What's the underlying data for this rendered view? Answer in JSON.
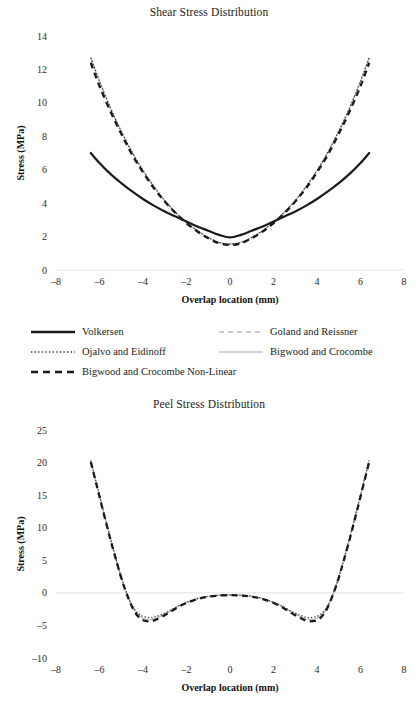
{
  "chart_data": [
    {
      "type": "line",
      "title": "Shear Stress Distribution",
      "xlabel": "Overlap location (mm)",
      "ylabel": "Stress (MPa)",
      "xlim": [
        -8,
        8
      ],
      "ylim": [
        0,
        14
      ],
      "xticks": [
        -8,
        -6,
        -4,
        -2,
        0,
        2,
        4,
        6,
        8
      ],
      "yticks": [
        0,
        2,
        4,
        6,
        8,
        10,
        12,
        14
      ],
      "grid": false,
      "legend_position": "below",
      "x": [
        -6.4,
        -6.0,
        -5.5,
        -5.0,
        -4.5,
        -4.0,
        -3.5,
        -3.0,
        -2.5,
        -2.0,
        -1.5,
        -1.0,
        -0.5,
        0.0,
        0.5,
        1.0,
        1.5,
        2.0,
        2.5,
        3.0,
        3.5,
        4.0,
        4.5,
        5.0,
        5.5,
        6.0,
        6.4
      ],
      "series": [
        {
          "name": "Volkersen",
          "style": "solid",
          "color": "#1a1a1a",
          "width": 2.2,
          "values": [
            7.0,
            6.4,
            5.75,
            5.2,
            4.7,
            4.25,
            3.85,
            3.5,
            3.2,
            2.9,
            2.6,
            2.35,
            2.1,
            1.95,
            2.1,
            2.35,
            2.6,
            2.9,
            3.2,
            3.5,
            3.85,
            4.25,
            4.7,
            5.2,
            5.75,
            6.4,
            7.0
          ]
        },
        {
          "name": "Goland and Reissner",
          "style": "dashed",
          "color": "#b9b9b9",
          "width": 1.2,
          "values": [
            12.7,
            11.3,
            9.7,
            8.3,
            7.05,
            5.95,
            5.0,
            4.15,
            3.45,
            2.85,
            2.35,
            1.95,
            1.65,
            1.55,
            1.65,
            1.95,
            2.35,
            2.85,
            3.45,
            4.15,
            5.0,
            5.95,
            7.05,
            8.3,
            9.7,
            11.3,
            12.7
          ]
        },
        {
          "name": "Ojalvo and Eidinoff",
          "style": "dotted",
          "color": "#3a3a3a",
          "width": 1.3,
          "values": [
            12.7,
            11.3,
            9.7,
            8.3,
            7.05,
            5.95,
            5.0,
            4.15,
            3.45,
            2.85,
            2.35,
            1.95,
            1.65,
            1.55,
            1.65,
            1.95,
            2.35,
            2.85,
            3.45,
            4.15,
            5.0,
            5.95,
            7.05,
            8.3,
            9.7,
            11.3,
            12.7
          ]
        },
        {
          "name": "Bigwood and Crocombe",
          "style": "solid-light",
          "color": "#c4c4c4",
          "width": 1.1,
          "values": [
            12.7,
            11.3,
            9.7,
            8.3,
            7.05,
            5.95,
            5.0,
            4.15,
            3.45,
            2.85,
            2.35,
            1.95,
            1.65,
            1.55,
            1.65,
            1.95,
            2.35,
            2.85,
            3.45,
            4.15,
            5.0,
            5.95,
            7.05,
            8.3,
            9.7,
            11.3,
            12.7
          ]
        },
        {
          "name": "Bigwood and Crocombe Non-Linear",
          "style": "thick-dashed",
          "color": "#1a1a1a",
          "width": 2.3,
          "values": [
            12.4,
            11.0,
            9.5,
            8.15,
            6.9,
            5.85,
            4.9,
            4.1,
            3.4,
            2.8,
            2.3,
            1.9,
            1.6,
            1.5,
            1.6,
            1.9,
            2.3,
            2.8,
            3.4,
            4.1,
            4.9,
            5.85,
            6.9,
            8.15,
            9.5,
            11.0,
            12.4
          ]
        }
      ]
    },
    {
      "type": "line",
      "title": "Peel Stress Distribution",
      "xlabel": "Overlap location (mm)",
      "ylabel": "Stress (MPa)",
      "xlim": [
        -8,
        8
      ],
      "ylim": [
        -10,
        25
      ],
      "xticks": [
        -8,
        -6,
        -4,
        -2,
        0,
        2,
        4,
        6,
        8
      ],
      "yticks": [
        -10,
        -5,
        0,
        5,
        10,
        15,
        20,
        25
      ],
      "grid": false,
      "legend_position": "shared-above",
      "x": [
        -6.4,
        -6.1,
        -5.8,
        -5.5,
        -5.2,
        -5.0,
        -4.8,
        -4.6,
        -4.4,
        -4.2,
        -4.0,
        -3.6,
        -3.2,
        -2.8,
        -2.4,
        -2.0,
        -1.5,
        -1.0,
        -0.5,
        0.0,
        0.5,
        1.0,
        1.5,
        2.0,
        2.4,
        2.8,
        3.2,
        3.6,
        4.0,
        4.2,
        4.4,
        4.6,
        4.8,
        5.0,
        5.2,
        5.5,
        5.8,
        6.1,
        6.4
      ],
      "series": [
        {
          "name": "Goland and Reissner",
          "style": "dashed",
          "color": "#b9b9b9",
          "width": 1.2,
          "values": [
            20.3,
            16.3,
            12.3,
            8.4,
            4.7,
            2.4,
            0.4,
            -1.3,
            -2.6,
            -3.4,
            -3.9,
            -4.1,
            -3.6,
            -2.9,
            -2.1,
            -1.5,
            -0.9,
            -0.55,
            -0.38,
            -0.33,
            -0.38,
            -0.55,
            -0.9,
            -1.5,
            -2.1,
            -2.9,
            -3.6,
            -4.1,
            -3.9,
            -3.4,
            -2.6,
            -1.3,
            0.4,
            2.4,
            4.7,
            8.4,
            12.3,
            16.3,
            20.3
          ]
        },
        {
          "name": "Ojalvo and Eidinoff",
          "style": "dotted",
          "color": "#3a3a3a",
          "width": 1.3,
          "values": [
            20.3,
            16.3,
            12.3,
            8.4,
            4.7,
            2.4,
            0.4,
            -1.3,
            -2.5,
            -3.2,
            -3.6,
            -3.8,
            -3.4,
            -2.8,
            -2.05,
            -1.45,
            -0.88,
            -0.53,
            -0.36,
            -0.31,
            -0.36,
            -0.53,
            -0.88,
            -1.45,
            -2.05,
            -2.8,
            -3.4,
            -3.8,
            -3.6,
            -3.2,
            -2.5,
            -1.3,
            0.4,
            2.4,
            4.7,
            8.4,
            12.3,
            16.3,
            20.3
          ]
        },
        {
          "name": "Bigwood and Crocombe",
          "style": "solid-light",
          "color": "#c4c4c4",
          "width": 1.1,
          "values": [
            20.3,
            16.3,
            12.3,
            8.4,
            4.7,
            2.4,
            0.4,
            -1.3,
            -2.6,
            -3.4,
            -3.9,
            -4.1,
            -3.6,
            -2.9,
            -2.1,
            -1.5,
            -0.9,
            -0.55,
            -0.38,
            -0.33,
            -0.38,
            -0.55,
            -0.9,
            -1.5,
            -2.1,
            -2.9,
            -3.6,
            -4.1,
            -3.9,
            -3.4,
            -2.6,
            -1.3,
            0.4,
            2.4,
            4.7,
            8.4,
            12.3,
            16.3,
            20.3
          ]
        },
        {
          "name": "Bigwood and Crocombe Non-Linear",
          "style": "thick-dashed",
          "color": "#1a1a1a",
          "width": 2.3,
          "values": [
            20.1,
            16.1,
            12.1,
            8.2,
            4.6,
            2.3,
            0.3,
            -1.4,
            -2.8,
            -3.7,
            -4.2,
            -4.35,
            -3.8,
            -3.05,
            -2.2,
            -1.55,
            -0.95,
            -0.6,
            -0.42,
            -0.36,
            -0.42,
            -0.6,
            -0.95,
            -1.55,
            -2.2,
            -3.05,
            -3.8,
            -4.35,
            -4.2,
            -3.7,
            -2.8,
            -1.4,
            0.3,
            2.3,
            4.6,
            8.2,
            12.1,
            16.1,
            20.1
          ]
        }
      ]
    }
  ],
  "shear": {
    "title": "Shear Stress Distribution",
    "ylabel": "Stress (MPa)",
    "xlabel": "Overlap location (mm)",
    "yticks": [
      "14",
      "12",
      "10",
      "8",
      "6",
      "4",
      "2",
      "0"
    ],
    "xticks": [
      "-8",
      "-6",
      "-4",
      "-2",
      "0",
      "2",
      "4",
      "6",
      "8"
    ]
  },
  "peel": {
    "title": "Peel Stress Distribution",
    "ylabel": "Stress (MPa)",
    "xlabel": "Overlap location (mm)",
    "yticks": [
      "25",
      "20",
      "15",
      "10",
      "5",
      "0",
      "-5",
      "-10"
    ],
    "xticks": [
      "-8",
      "-6",
      "-4",
      "-2",
      "0",
      "2",
      "4",
      "6",
      "8"
    ]
  },
  "legend": {
    "items": [
      {
        "label": "Volkersen",
        "style": "solid",
        "color": "#1a1a1a"
      },
      {
        "label": "Ojalvo and Eidinoff",
        "style": "dotted",
        "color": "#3a3a3a"
      },
      {
        "label": "Bigwood and Crocombe Non-Linear",
        "style": "thick-dashed",
        "color": "#1a1a1a"
      },
      {
        "label": "Goland and Reissner",
        "style": "dashed",
        "color": "#b9b9b9"
      },
      {
        "label": "Bigwood and Crocombe",
        "style": "solid-light",
        "color": "#c4c4c4"
      }
    ]
  }
}
